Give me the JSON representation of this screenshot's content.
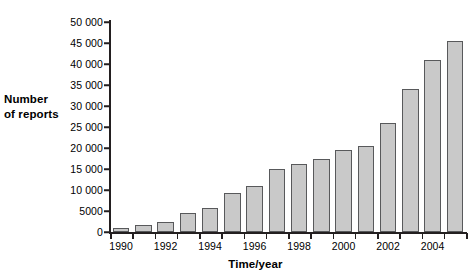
{
  "chart_data": {
    "type": "bar",
    "title": "",
    "xlabel": "Time/year",
    "ylabel": "Number of reports",
    "ylabel_lines": [
      "Number",
      "of reports"
    ],
    "categories": [
      "1990",
      "1991",
      "1992",
      "1993",
      "1994",
      "1995",
      "1996",
      "1997",
      "1998",
      "1999",
      "2000",
      "2001",
      "2002",
      "2003",
      "2004",
      "2005"
    ],
    "values": [
      900,
      1700,
      2400,
      4600,
      5700,
      9300,
      11000,
      14900,
      16200,
      17500,
      19500,
      20400,
      26000,
      34000,
      41000,
      45500
    ],
    "ylim": [
      0,
      50000
    ],
    "ytick_values": [
      0,
      5000,
      10000,
      15000,
      20000,
      25000,
      30000,
      35000,
      40000,
      45000,
      50000
    ],
    "ytick_labels": [
      "0",
      "5000",
      "10 000",
      "15 000",
      "20 000",
      "25 000",
      "30 000",
      "35 000",
      "40 000",
      "45 000",
      "50 000"
    ],
    "xtick_labels": [
      "1990",
      "1992",
      "1994",
      "1996",
      "1998",
      "2000",
      "2002",
      "2004"
    ],
    "grid": false,
    "legend": null,
    "bar_fill_color": "#c9c9c9",
    "bar_border_color": "#58595b",
    "axis_color": "#231f20"
  }
}
